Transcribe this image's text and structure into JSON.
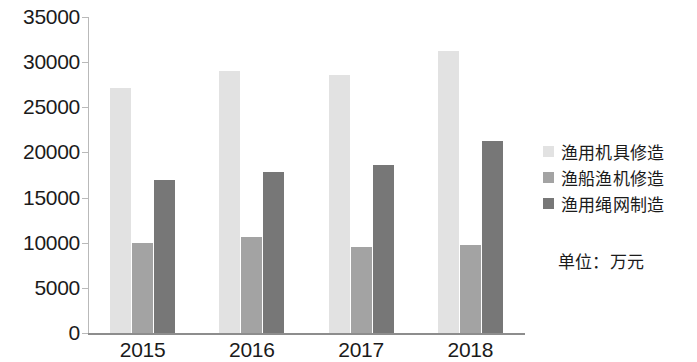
{
  "chart_data": {
    "type": "bar",
    "title": "",
    "subtitle": "",
    "xlabel": "",
    "ylabel": "",
    "categories": [
      "2015",
      "2016",
      "2017",
      "2018"
    ],
    "series": [
      {
        "name": "渔用机具修造",
        "color": "#e2e2e2",
        "values": [
          27100,
          29000,
          28600,
          31200
        ]
      },
      {
        "name": "渔船渔机修造",
        "color": "#a3a3a3",
        "values": [
          10000,
          10600,
          9500,
          9700
        ]
      },
      {
        "name": "渔用绳网制造",
        "color": "#777777",
        "values": [
          16900,
          17800,
          18600,
          21300
        ]
      }
    ],
    "ylim": [
      0,
      35000
    ],
    "ytick_labels": [
      "0",
      "5000",
      "10000",
      "15000",
      "20000",
      "25000",
      "30000",
      "35000"
    ],
    "ytick_values": [
      0,
      5000,
      10000,
      15000,
      20000,
      25000,
      30000,
      35000
    ],
    "grid": false,
    "legend_position": "right",
    "unit_note": "单位：万元"
  }
}
